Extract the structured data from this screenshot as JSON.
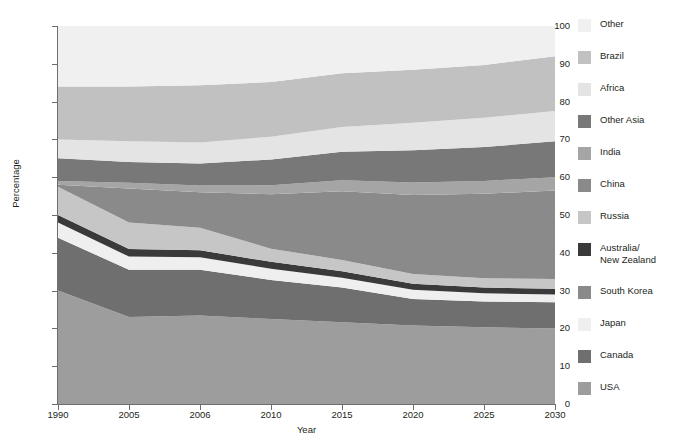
{
  "chart_data": {
    "type": "area",
    "stacked": true,
    "title": "",
    "xlabel": "Year",
    "ylabel": "Percentage",
    "categories": [
      "1990",
      "2005",
      "2006",
      "2010",
      "2015",
      "2020",
      "2025",
      "2030"
    ],
    "x_tick_labels": [
      "1990",
      "2005",
      "2006",
      "2010",
      "2015",
      "2020",
      "2025",
      "2030"
    ],
    "y_tick_labels": [
      "0",
      "10",
      "20",
      "30",
      "40",
      "50",
      "60",
      "70",
      "80",
      "90",
      "100"
    ],
    "ylim": [
      0,
      100
    ],
    "y_tick_step": 10,
    "grid": false,
    "legend_position": "right",
    "stack_order_bottom_to_top": [
      "USA",
      "Canada",
      "Japan",
      "Australia/New Zealand",
      "Russia",
      "China",
      "India",
      "Other Asia",
      "Africa",
      "Brazil",
      "Other"
    ],
    "series": [
      {
        "name": "USA",
        "color": "#9d9d9d",
        "values": [
          30.0,
          23.0,
          23.4,
          22.5,
          21.6,
          20.8,
          20.3,
          20.0
        ]
      },
      {
        "name": "Canada",
        "color": "#6f6f6f",
        "values": [
          14.0,
          12.5,
          12.1,
          10.3,
          9.2,
          7.0,
          6.8,
          6.9
        ]
      },
      {
        "name": "Japan",
        "color": "#efefef",
        "values": [
          4.0,
          3.5,
          3.3,
          3.0,
          2.6,
          2.4,
          2.2,
          2.1
        ]
      },
      {
        "name": "Australia/New Zealand",
        "color": "#3a3a3a",
        "values": [
          2.0,
          2.0,
          1.9,
          1.8,
          1.7,
          1.6,
          1.5,
          1.5
        ]
      },
      {
        "name": "Russia",
        "color": "#c6c6c6",
        "values": [
          7.5,
          7.0,
          5.9,
          3.5,
          3.0,
          2.6,
          2.5,
          2.6
        ]
      },
      {
        "name": "China",
        "color": "#8a8a8a",
        "values": [
          0.5,
          9.0,
          9.4,
          14.4,
          18.2,
          20.9,
          22.3,
          23.4
        ]
      },
      {
        "name": "India",
        "color": "#a5a5a5",
        "values": [
          1.0,
          1.5,
          1.8,
          2.4,
          2.9,
          3.3,
          3.4,
          3.5
        ]
      },
      {
        "name": "Other Asia",
        "color": "#787878",
        "values": [
          6.0,
          5.5,
          5.8,
          6.8,
          7.5,
          8.5,
          9.0,
          9.5
        ]
      },
      {
        "name": "Africa",
        "color": "#e4e4e4",
        "values": [
          5.0,
          5.5,
          5.6,
          6.0,
          6.6,
          7.3,
          7.7,
          8.0
        ]
      },
      {
        "name": "Brazil",
        "color": "#c1c1c1",
        "values": [
          14.0,
          14.5,
          15.1,
          14.5,
          14.2,
          14.0,
          14.0,
          14.5
        ]
      },
      {
        "name": "Other",
        "color": "#f0f0f0",
        "values": [
          16.0,
          16.0,
          15.7,
          14.8,
          12.5,
          11.6,
          10.3,
          8.0
        ]
      }
    ]
  },
  "legend": {
    "items": [
      {
        "label": "Other",
        "color": "#f0f0f0"
      },
      {
        "label": "Brazil",
        "color": "#c1c1c1"
      },
      {
        "label": "Africa",
        "color": "#e4e4e4"
      },
      {
        "label": "Other Asia",
        "color": "#787878"
      },
      {
        "label": "India",
        "color": "#a5a5a5"
      },
      {
        "label": "China",
        "color": "#8a8a8a"
      },
      {
        "label": "Russia",
        "color": "#c6c6c6"
      },
      {
        "label": "Australia/\nNew Zealand",
        "color": "#3a3a3a"
      },
      {
        "label": "South Korea",
        "color": "#8a8a8a"
      },
      {
        "label": "Japan",
        "color": "#efefef"
      },
      {
        "label": "Canada",
        "color": "#6f6f6f"
      },
      {
        "label": "USA",
        "color": "#9d9d9d"
      }
    ]
  }
}
